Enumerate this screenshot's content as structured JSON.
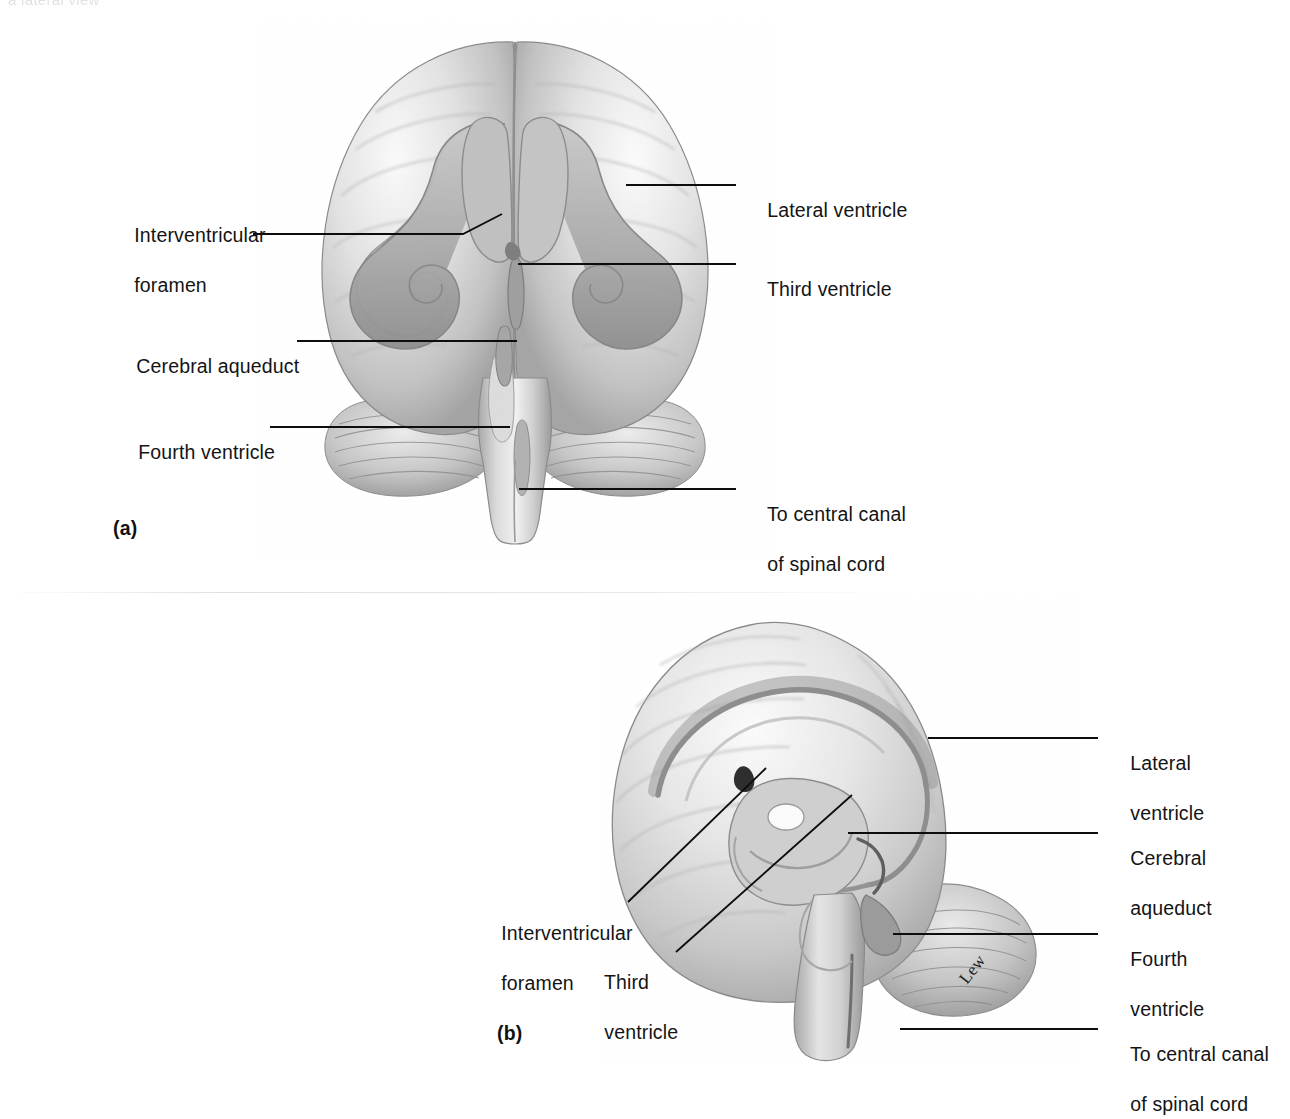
{
  "figure": {
    "cropped_header_text": "a lateral view",
    "artist_signature": "Lew"
  },
  "panel_a": {
    "letter": "(a)",
    "view": "anterior-view-ventricles",
    "labels": [
      {
        "id": "interventricular-foramen",
        "line1": "Interventricular",
        "line2": "foramen"
      },
      {
        "id": "lateral-ventricle",
        "line1": "Lateral ventricle",
        "line2": ""
      },
      {
        "id": "third-ventricle",
        "line1": "Third ventricle",
        "line2": ""
      },
      {
        "id": "cerebral-aqueduct",
        "line1": "Cerebral aqueduct",
        "line2": ""
      },
      {
        "id": "fourth-ventricle",
        "line1": "Fourth ventricle",
        "line2": ""
      },
      {
        "id": "to-central-canal",
        "line1": "To central canal",
        "line2": "of spinal cord"
      }
    ]
  },
  "panel_b": {
    "letter": "(b)",
    "view": "lateral-sagittal-view-ventricles",
    "labels": [
      {
        "id": "lateral-ventricle",
        "line1": "Lateral",
        "line2": "ventricle"
      },
      {
        "id": "cerebral-aqueduct",
        "line1": "Cerebral",
        "line2": "aqueduct"
      },
      {
        "id": "fourth-ventricle",
        "line1": "Fourth",
        "line2": "ventricle"
      },
      {
        "id": "to-central-canal",
        "line1": "To central canal",
        "line2": "of spinal cord"
      },
      {
        "id": "interventricular-foramen",
        "line1": "Interventricular",
        "line2": "foramen"
      },
      {
        "id": "third-ventricle",
        "line1": "Third",
        "line2": "ventricle"
      }
    ]
  },
  "colors": {
    "ink": "#141414",
    "leader": "#0d0d0d",
    "tissue_light": "#f2f2f2",
    "tissue_mid": "#cfcfcf",
    "tissue_dark": "#9d9d9d",
    "ventricle_fill": "#b6b6b6",
    "page_background": "#ffffff"
  }
}
